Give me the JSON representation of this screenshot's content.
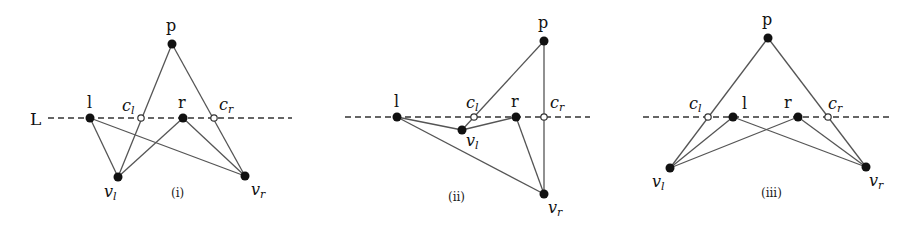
{
  "line_label": "L",
  "diagrams": [
    {
      "caption": "(i)",
      "labels": {
        "p": "p",
        "l": "l",
        "r": "r",
        "cl": "c",
        "cl_sub": "l",
        "cr": "c",
        "cr_sub": "r",
        "vl": "v",
        "vl_sub": "l",
        "vr": "v",
        "vr_sub": "r"
      }
    },
    {
      "caption": "(ii)",
      "labels": {
        "p": "p",
        "l": "l",
        "r": "r",
        "cl": "c",
        "cl_sub": "l",
        "cr": "c",
        "cr_sub": "r",
        "vl": "v",
        "vl_sub": "l",
        "vr": "v",
        "vr_sub": "r"
      }
    },
    {
      "caption": "(iii)",
      "labels": {
        "p": "p",
        "l": "l",
        "r": "r",
        "cl": "c",
        "cl_sub": "l",
        "cr": "c",
        "cr_sub": "r",
        "vl": "v",
        "vl_sub": "l",
        "vr": "v",
        "vr_sub": "r"
      }
    }
  ],
  "colors": {
    "edge": "#555555",
    "vertex": "#111111",
    "crossing_fill": "#ffffff"
  }
}
